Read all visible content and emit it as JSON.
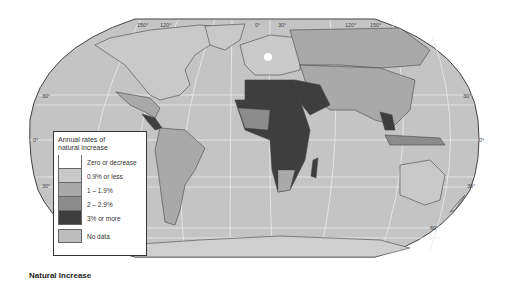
{
  "title": "Natural Increase",
  "legend": {
    "title_line1": "Annual rates of",
    "title_line2": "natural increase",
    "items": [
      {
        "label": "Zero or decrease",
        "color": "#ffffff"
      },
      {
        "label": "0.9% or less",
        "color": "#c9c9c9"
      },
      {
        "label": "1 – 1.9%",
        "color": "#a9a9a9"
      },
      {
        "label": "2 – 2.9%",
        "color": "#8c8c8c"
      },
      {
        "label": "3% or more",
        "color": "#3e3e3e"
      },
      {
        "label": "No data",
        "color": "#bdbdbd"
      }
    ]
  },
  "graticule_labels": {
    "top": [
      "150°",
      "120°",
      "0°",
      "30°",
      "120°",
      "150°"
    ],
    "left": [
      "30°",
      "0°",
      "30°"
    ],
    "right": [
      "30°",
      "0°",
      "30°",
      "60°"
    ]
  },
  "colors": {
    "ocean": "#c4c4c4",
    "border": "#444444",
    "graticule": "#ececec"
  }
}
